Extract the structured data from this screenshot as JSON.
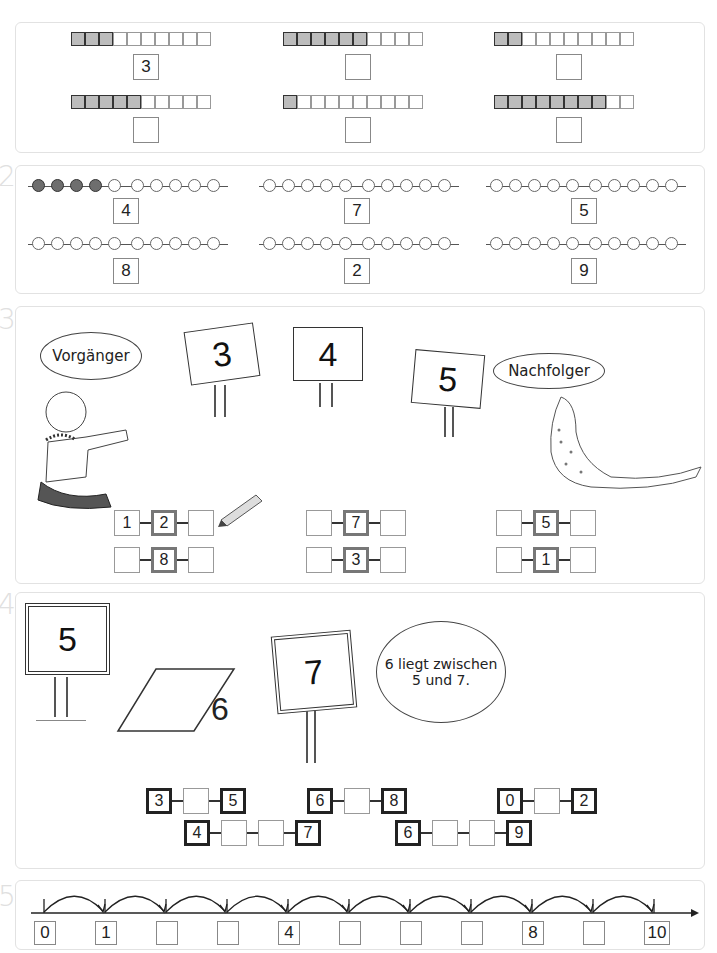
{
  "exercise_numbers": [
    "1",
    "2",
    "3",
    "4",
    "5"
  ],
  "ex1": {
    "items": [
      {
        "filled": 3,
        "total": 10,
        "answer": "3"
      },
      {
        "filled": 6,
        "total": 10,
        "answer": ""
      },
      {
        "filled": 2,
        "total": 10,
        "answer": ""
      },
      {
        "filled": 5,
        "total": 10,
        "answer": ""
      },
      {
        "filled": 1,
        "total": 10,
        "answer": ""
      },
      {
        "filled": 8,
        "total": 10,
        "answer": ""
      }
    ]
  },
  "ex2": {
    "items": [
      {
        "filled": 4,
        "total": 10,
        "target": "4"
      },
      {
        "filled": 0,
        "total": 10,
        "target": "7"
      },
      {
        "filled": 0,
        "total": 10,
        "target": "5"
      },
      {
        "filled": 0,
        "total": 10,
        "target": "8"
      },
      {
        "filled": 0,
        "total": 10,
        "target": "2"
      },
      {
        "filled": 0,
        "total": 10,
        "target": "9"
      }
    ]
  },
  "ex3": {
    "bubble_left": "Vorgänger",
    "bubble_right": "Nachfolger",
    "signs": [
      "3",
      "4",
      "5"
    ],
    "chains": [
      {
        "prev": "1",
        "mid": "2",
        "next": ""
      },
      {
        "prev": "",
        "mid": "7",
        "next": ""
      },
      {
        "prev": "",
        "mid": "5",
        "next": ""
      },
      {
        "prev": "",
        "mid": "8",
        "next": ""
      },
      {
        "prev": "",
        "mid": "3",
        "next": ""
      },
      {
        "prev": "",
        "mid": "1",
        "next": ""
      }
    ]
  },
  "ex4": {
    "signs": [
      "5",
      "6",
      "7"
    ],
    "bubble": "6 liegt zwischen 5 und 7.",
    "bubble_line1": "6 liegt zwischen",
    "bubble_line2": "5 und 7.",
    "chains": [
      {
        "values": [
          "3",
          "",
          "5"
        ]
      },
      {
        "values": [
          "6",
          "",
          "8"
        ]
      },
      {
        "values": [
          "0",
          "",
          "2"
        ]
      },
      {
        "values": [
          "4",
          "",
          "",
          "7"
        ]
      },
      {
        "values": [
          "6",
          "",
          "",
          "9"
        ]
      }
    ]
  },
  "ex5": {
    "number_line": [
      "0",
      "1",
      "",
      "",
      "4",
      "",
      "",
      "",
      "8",
      "",
      "10"
    ]
  }
}
